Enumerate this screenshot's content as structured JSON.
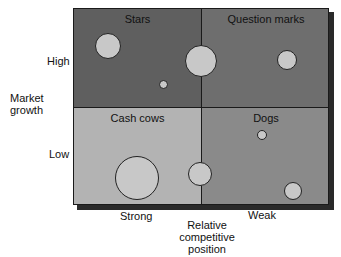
{
  "diagram": {
    "type": "bcg-growth-share-matrix",
    "quadrants": [
      {
        "id": "stars",
        "label": "Stars",
        "position": "top-left",
        "color": "#5f5f5f"
      },
      {
        "id": "question_marks",
        "label": "Question marks",
        "position": "top-right",
        "color": "#6e6e6e"
      },
      {
        "id": "cash_cows",
        "label": "Cash cows",
        "position": "bottom-left",
        "color": "#b3b3b3"
      },
      {
        "id": "dogs",
        "label": "Dogs",
        "position": "bottom-right",
        "color": "#8a8a8a"
      }
    ],
    "y_axis": {
      "title_line1": "Market",
      "title_line2": "growth",
      "high": "High",
      "low": "Low"
    },
    "x_axis": {
      "strong": "Strong",
      "weak": "Weak",
      "title_line1": "Relative",
      "title_line2": "competitive",
      "title_line3": "position"
    },
    "circle_color": "#c8c8c8",
    "circles": [
      {
        "cx": 108,
        "cy": 46,
        "r": 13
      },
      {
        "cx": 163,
        "cy": 84,
        "r": 4
      },
      {
        "cx": 201,
        "cy": 61,
        "r": 16
      },
      {
        "cx": 287,
        "cy": 60,
        "r": 10
      },
      {
        "cx": 137,
        "cy": 178,
        "r": 22
      },
      {
        "cx": 200,
        "cy": 174,
        "r": 12
      },
      {
        "cx": 262,
        "cy": 135,
        "r": 5
      },
      {
        "cx": 293,
        "cy": 191,
        "r": 9
      }
    ]
  }
}
